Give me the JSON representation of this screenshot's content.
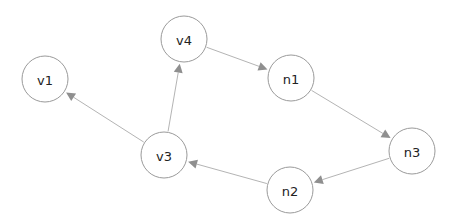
{
  "diagram": {
    "type": "directed-graph",
    "colors": {
      "background": "#ffffff",
      "node_stroke": "#9a9a9a",
      "edge": "#b4b4b4",
      "arrowhead": "#8f8f8f",
      "label": "#222222"
    },
    "node_radius": 23,
    "nodes": [
      {
        "id": "v1",
        "label": "v1",
        "x": 45,
        "y": 79
      },
      {
        "id": "v4",
        "label": "v4",
        "x": 184,
        "y": 39
      },
      {
        "id": "n1",
        "label": "n1",
        "x": 291,
        "y": 78
      },
      {
        "id": "v3",
        "label": "v3",
        "x": 164,
        "y": 155
      },
      {
        "id": "n3",
        "label": "n3",
        "x": 412,
        "y": 151
      },
      {
        "id": "n2",
        "label": "n2",
        "x": 290,
        "y": 190
      }
    ],
    "edges": [
      {
        "from": "v3",
        "to": "v1"
      },
      {
        "from": "v3",
        "to": "v4"
      },
      {
        "from": "v4",
        "to": "n1"
      },
      {
        "from": "n1",
        "to": "n3"
      },
      {
        "from": "n3",
        "to": "n2"
      },
      {
        "from": "n2",
        "to": "v3"
      }
    ]
  }
}
